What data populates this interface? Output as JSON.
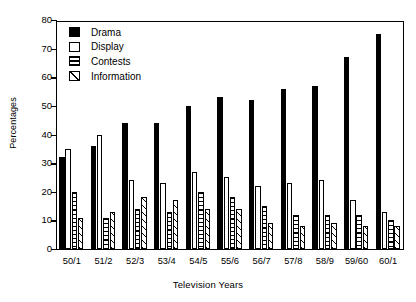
{
  "chart_data": {
    "type": "bar",
    "title": "",
    "xlabel": "Television Years",
    "ylabel": "Percentages",
    "ylim": [
      0,
      80
    ],
    "yticks": [
      0,
      10,
      20,
      30,
      40,
      50,
      60,
      70,
      80
    ],
    "grid": false,
    "legend_position": "top-left",
    "categories": [
      "50/1",
      "51/2",
      "52/3",
      "53/4",
      "54/5",
      "55/6",
      "56/7",
      "57/8",
      "58/9",
      "59/60",
      "60/1"
    ],
    "series": [
      {
        "name": "Drama",
        "fill": "solid-black",
        "values": [
          32,
          36,
          44,
          44,
          50,
          53,
          52,
          56,
          57,
          67,
          75
        ]
      },
      {
        "name": "Display",
        "fill": "white",
        "values": [
          35,
          40,
          24,
          23,
          27,
          25,
          22,
          23,
          24,
          17,
          13
        ]
      },
      {
        "name": "Contests",
        "fill": "horizontal-lines",
        "values": [
          20,
          11,
          14,
          13,
          20,
          18,
          15,
          12,
          12,
          12,
          10
        ]
      },
      {
        "name": "Information",
        "fill": "diagonal-hatch",
        "values": [
          11,
          13,
          18,
          17,
          14,
          14,
          9,
          8,
          9,
          8,
          8
        ]
      }
    ]
  },
  "legend": {
    "items": [
      {
        "label": "Drama",
        "swatch": "solid-black-swatch"
      },
      {
        "label": "Display",
        "swatch": "white-swatch"
      },
      {
        "label": "Contests",
        "swatch": "horizontal-lines-swatch"
      },
      {
        "label": "Information",
        "swatch": "diagonal-hatch-swatch"
      }
    ]
  },
  "colors": {
    "ink": "#000000",
    "background": "#ffffff"
  }
}
